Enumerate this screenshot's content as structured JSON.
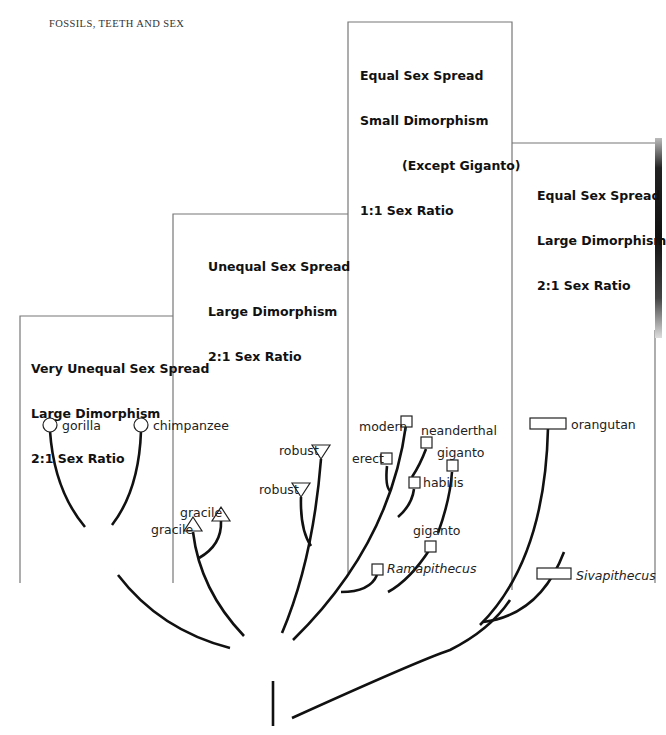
{
  "header": {
    "running_title": "FOSSILS, TEETH AND SEX"
  },
  "boxes": [
    {
      "id": "box-1",
      "lines": [
        "Very Unequal Sex Spread",
        "Large Dimorphism",
        "2:1 Sex Ratio"
      ]
    },
    {
      "id": "box-2",
      "lines": [
        "Unequal Sex Spread",
        "Large Dimorphism",
        "2:1 Sex Ratio"
      ]
    },
    {
      "id": "box-3",
      "lines": [
        "Equal Sex Spread",
        "Small Dimorphism",
        "(Except Giganto)",
        "1:1 Sex Ratio"
      ]
    },
    {
      "id": "box-4",
      "lines": [
        "Equal Sex Spread",
        "Large Dimorphism",
        "2:1 Sex Ratio"
      ]
    }
  ],
  "taxa": {
    "gorilla": {
      "label": "gorilla",
      "marker": "circle"
    },
    "chimpanzee": {
      "label": "chimpanzee",
      "marker": "circle"
    },
    "gracile_1": {
      "label": "gracile",
      "marker": "triangle-up"
    },
    "gracile_2": {
      "label": "gracile",
      "marker": "triangle-up"
    },
    "robust_1": {
      "label": "robust",
      "marker": "triangle-down"
    },
    "robust_2": {
      "label": "robust",
      "marker": "triangle-down"
    },
    "modern": {
      "label": "modern",
      "marker": "square"
    },
    "neanderthal": {
      "label": "neanderthal",
      "marker": "square"
    },
    "erect": {
      "label": "erect",
      "marker": "square"
    },
    "giganto_1": {
      "label": "giganto",
      "marker": "square"
    },
    "habilis": {
      "label": "habilis",
      "marker": "square"
    },
    "giganto_2": {
      "label": "giganto",
      "marker": "square"
    },
    "ramapithecus": {
      "label": "Ramapithecus",
      "marker": "square",
      "italic": true
    },
    "orangutan": {
      "label": "orangutan",
      "marker": "wide-rectangle"
    },
    "sivapithecus": {
      "label": "Sivapithecus",
      "marker": "wide-rectangle",
      "italic": true
    }
  },
  "colors": {
    "line": "#111111",
    "frame": "#666666",
    "background": "#ffffff"
  }
}
